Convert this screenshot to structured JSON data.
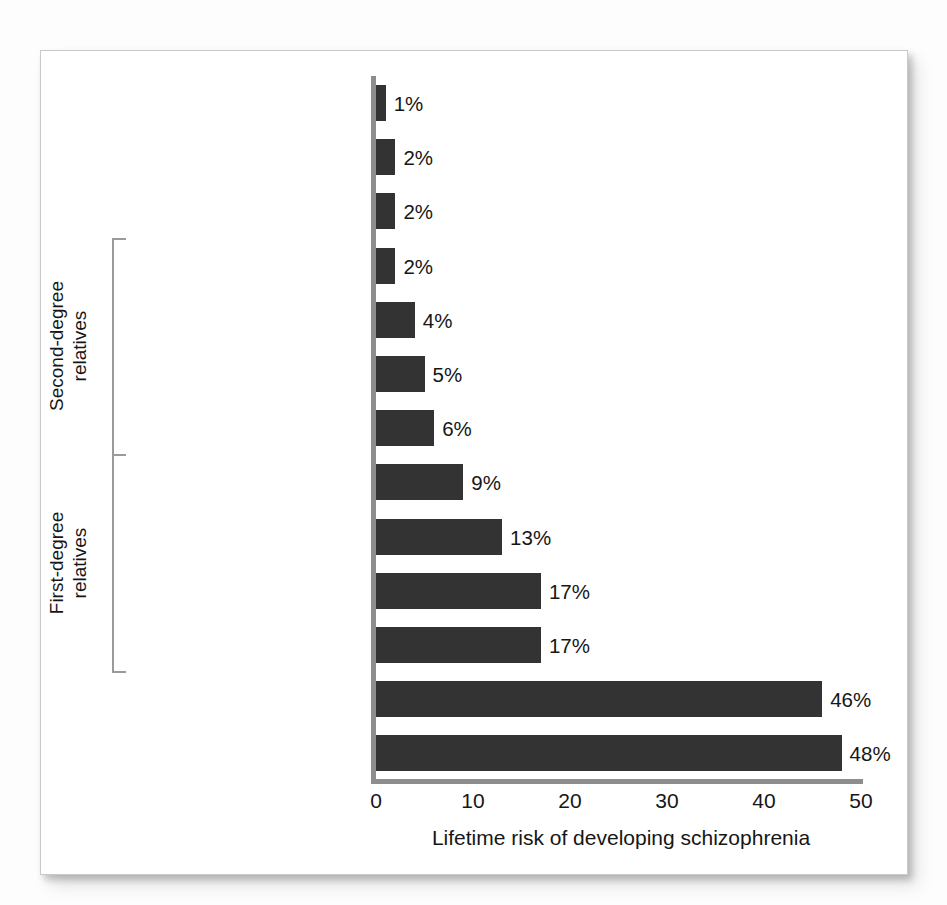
{
  "chart_data": {
    "type": "bar",
    "orientation": "horizontal",
    "title": "",
    "xlabel": "Lifetime risk of developing schizophrenia",
    "ylabel": "",
    "xlim": [
      0,
      50
    ],
    "xticks": [
      "0",
      "10",
      "20",
      "30",
      "40",
      "50"
    ],
    "grid": false,
    "legend": null,
    "bar_color": "#333333",
    "axis_color": "#8d8d8d",
    "categories": [
      "General population",
      "Spouses of patients",
      "First cousins\n(third degree)",
      "Uncles/aunts",
      "Nephews/nieces",
      "Grandchildren",
      "Half siblings",
      "Siblings",
      "Child of 1 parent\nwith schizophrenia",
      "Siblings with 1 parent\nwith schizophrenia",
      "Fraternal twins",
      "Child of 2 parents\nwith schizophrenia",
      "Identical twins"
    ],
    "values": [
      1,
      2,
      2,
      2,
      4,
      5,
      6,
      9,
      13,
      17,
      17,
      46,
      48
    ],
    "value_labels": [
      "1%",
      "2%",
      "2%",
      "2%",
      "4%",
      "5%",
      "6%",
      "9%",
      "13%",
      "17%",
      "17%",
      "46%",
      "48%"
    ],
    "groups": [
      {
        "label": "Second-degree\nrelatives",
        "first_index": 3,
        "last_index": 6
      },
      {
        "label": "First-degree\nrelatives",
        "first_index": 7,
        "last_index": 10
      }
    ]
  }
}
